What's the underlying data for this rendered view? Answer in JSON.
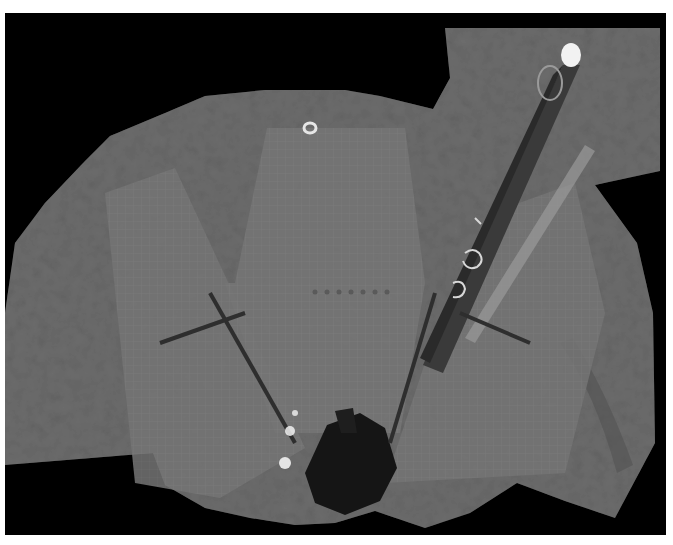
{
  "image": {
    "subject": "Mars rover deck self-portrait mosaic",
    "colors": {
      "background": "#000000",
      "border": "#ffffff",
      "terrain": "#6e6e6e",
      "terrain_dark": "#555555",
      "panel": "#767676",
      "panel_line": "#8c8c8c",
      "shadow": "#151515",
      "highlight": "#f2f2f2"
    }
  }
}
